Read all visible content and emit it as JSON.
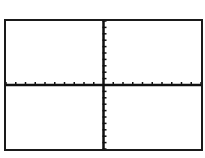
{
  "chart_data": {
    "type": "line",
    "title": "",
    "xlabel": "",
    "ylabel": "",
    "xlim": [
      -10,
      10
    ],
    "ylim": [
      -10,
      10
    ],
    "x_tick_interval": 1,
    "y_tick_interval": 1,
    "grid": false,
    "series": [],
    "colors": {
      "axis": "#111111",
      "frame": "#1a1a1a",
      "background": "#ffffff"
    }
  }
}
